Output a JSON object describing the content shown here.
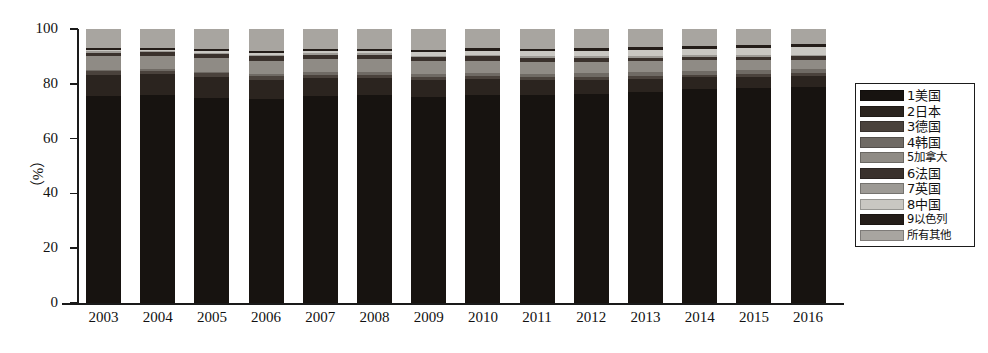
{
  "chart_data": {
    "type": "bar",
    "stacked": true,
    "percent_stacked": true,
    "title": "",
    "xlabel": "",
    "ylabel": "（%）",
    "ylim": [
      0,
      100
    ],
    "yticks": [
      0,
      20,
      40,
      60,
      80,
      100
    ],
    "ytick_labels": [
      "0",
      "20",
      "40",
      "60",
      "80",
      "100"
    ],
    "grid": false,
    "legend_position": "right",
    "categories": [
      "2003",
      "2004",
      "2005",
      "2006",
      "2007",
      "2008",
      "2009",
      "2010",
      "2011",
      "2012",
      "2013",
      "2014",
      "2015",
      "2016"
    ],
    "series": [
      {
        "name": "1美国",
        "color": "#171310",
        "values": [
          75.5,
          75.8,
          75.0,
          74.5,
          75.5,
          75.8,
          75.2,
          76.0,
          75.8,
          76.2,
          77.0,
          78.0,
          78.5,
          79.0
        ]
      },
      {
        "name": "2日本",
        "color": "#2b241f",
        "values": [
          7.9,
          7.7,
          7.6,
          7.0,
          6.6,
          6.3,
          6.2,
          5.8,
          5.6,
          5.2,
          4.9,
          4.4,
          4.1,
          3.8
        ]
      },
      {
        "name": "3德国",
        "color": "#4a423c",
        "values": [
          1.3,
          1.3,
          1.2,
          1.2,
          1.2,
          1.2,
          1.1,
          1.1,
          1.1,
          1.1,
          1.0,
          1.0,
          1.0,
          1.0
        ]
      },
      {
        "name": "4韩国",
        "color": "#6f6a64",
        "values": [
          0.5,
          0.6,
          0.7,
          0.8,
          0.9,
          1.0,
          1.1,
          1.2,
          1.2,
          1.3,
          1.3,
          1.4,
          1.4,
          1.5
        ]
      },
      {
        "name": "5加拿大",
        "color": "#8f8b85",
        "values": [
          5.0,
          4.9,
          5.1,
          5.0,
          4.8,
          4.7,
          4.6,
          4.4,
          4.3,
          4.2,
          4.0,
          3.8,
          3.6,
          3.5
        ]
      },
      {
        "name": "6法国",
        "color": "#3a312c",
        "values": [
          1.2,
          1.2,
          1.2,
          1.5,
          1.5,
          1.5,
          1.5,
          1.5,
          1.5,
          1.4,
          1.4,
          1.3,
          1.3,
          1.3
        ]
      },
      {
        "name": "7英国",
        "color": "#9d9a95",
        "values": [
          0.6,
          0.6,
          0.6,
          0.6,
          0.6,
          0.6,
          0.6,
          0.6,
          0.6,
          0.6,
          0.6,
          0.6,
          0.6,
          0.6
        ]
      },
      {
        "name": "8中国",
        "color": "#c9c7c2",
        "values": [
          0.3,
          0.4,
          0.5,
          0.6,
          0.8,
          0.9,
          1.2,
          1.5,
          1.8,
          2.0,
          2.2,
          2.4,
          2.6,
          2.8
        ]
      },
      {
        "name": "9以色列",
        "color": "#241d19",
        "values": [
          0.7,
          0.7,
          0.8,
          0.9,
          0.9,
          0.9,
          1.0,
          1.0,
          1.0,
          1.0,
          1.0,
          1.0,
          1.0,
          1.0
        ]
      },
      {
        "name": "所有其他",
        "color": "#a8a5a0",
        "values": [
          7.0,
          6.8,
          7.3,
          7.9,
          7.2,
          7.1,
          7.5,
          6.9,
          7.1,
          7.0,
          6.6,
          6.1,
          5.9,
          5.5
        ]
      }
    ]
  },
  "axis": {
    "ylabel": "（%）",
    "ytick_labels": [
      "100",
      "80",
      "60",
      "40",
      "20",
      "0"
    ],
    "xtick_labels": [
      "2003",
      "2004",
      "2005",
      "2006",
      "2007",
      "2008",
      "2009",
      "2010",
      "2011",
      "2012",
      "2013",
      "2014",
      "2015",
      "2016"
    ]
  },
  "legend": {
    "items": [
      {
        "label": "1美国",
        "color": "#171310"
      },
      {
        "label": "2日本",
        "color": "#2b241f"
      },
      {
        "label": "3德国",
        "color": "#4a423c"
      },
      {
        "label": "4韩国",
        "color": "#6f6a64"
      },
      {
        "label": "5加拿大",
        "color": "#8f8b85"
      },
      {
        "label": "6法国",
        "color": "#3a312c"
      },
      {
        "label": "7英国",
        "color": "#9d9a95"
      },
      {
        "label": "8中国",
        "color": "#c9c7c2"
      },
      {
        "label": "9以色列",
        "color": "#241d19"
      },
      {
        "label": "所有其他",
        "color": "#a8a5a0"
      }
    ]
  }
}
